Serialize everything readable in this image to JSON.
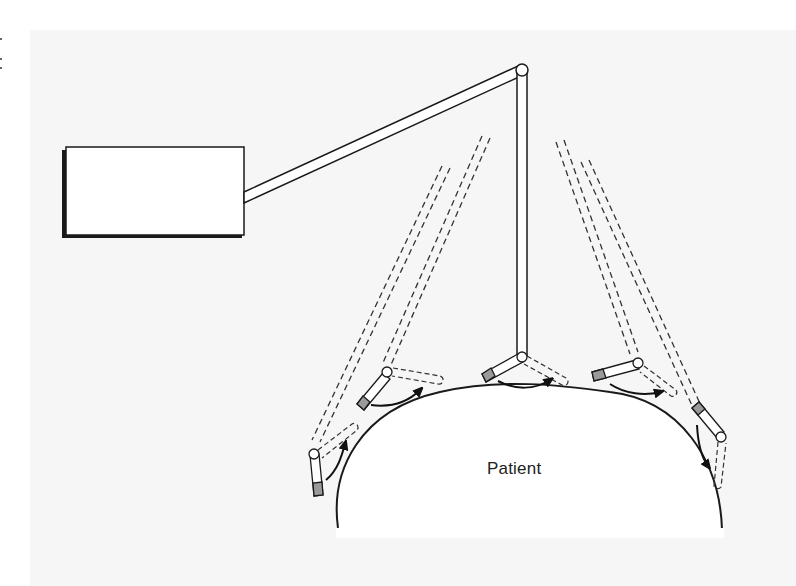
{
  "diagram": {
    "type": "medical-equipment-schematic",
    "labels": {
      "patient": "Patient"
    },
    "components": [
      {
        "name": "base-unit",
        "shape": "rectangle"
      },
      {
        "name": "upper-arm",
        "shape": "rod"
      },
      {
        "name": "vertical-arm",
        "shape": "rod"
      },
      {
        "name": "probe-positions",
        "count": 5
      }
    ],
    "colors": {
      "line": "#1a1a1a",
      "probe_tip": "#9a9a9a",
      "background": "#f6f6f6",
      "fill": "#ffffff"
    }
  }
}
